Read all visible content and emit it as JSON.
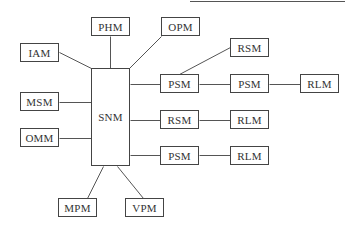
{
  "diagram": {
    "type": "block-diagram",
    "top_rule": {
      "x1": 190,
      "y1": 1,
      "x2": 345,
      "y2": 1
    },
    "nodes": [
      {
        "id": "iam",
        "label": "IAM",
        "x": 20,
        "y": 43,
        "w": 39,
        "h": 19
      },
      {
        "id": "phm",
        "label": "PHM",
        "x": 91,
        "y": 17,
        "w": 39,
        "h": 19
      },
      {
        "id": "opm",
        "label": "OPM",
        "x": 161,
        "y": 17,
        "w": 39,
        "h": 19
      },
      {
        "id": "snm",
        "label": "SNM",
        "x": 91,
        "y": 68,
        "w": 39,
        "h": 98
      },
      {
        "id": "msm",
        "label": "MSM",
        "x": 20,
        "y": 92,
        "w": 39,
        "h": 19
      },
      {
        "id": "omm",
        "label": "OMM",
        "x": 20,
        "y": 128,
        "w": 39,
        "h": 19
      },
      {
        "id": "psm1",
        "label": "PSM",
        "x": 160,
        "y": 74,
        "w": 39,
        "h": 19
      },
      {
        "id": "rsm1",
        "label": "RSM",
        "x": 230,
        "y": 38,
        "w": 39,
        "h": 19
      },
      {
        "id": "psm2",
        "label": "PSM",
        "x": 230,
        "y": 74,
        "w": 39,
        "h": 19
      },
      {
        "id": "rlm1",
        "label": "RLM",
        "x": 300,
        "y": 74,
        "w": 39,
        "h": 19
      },
      {
        "id": "rsm2",
        "label": "RSM",
        "x": 160,
        "y": 110,
        "w": 39,
        "h": 19
      },
      {
        "id": "rlm2",
        "label": "RLM",
        "x": 230,
        "y": 110,
        "w": 39,
        "h": 19
      },
      {
        "id": "psm3",
        "label": "PSM",
        "x": 160,
        "y": 146,
        "w": 39,
        "h": 19
      },
      {
        "id": "rlm3",
        "label": "RLM",
        "x": 230,
        "y": 146,
        "w": 39,
        "h": 19
      },
      {
        "id": "mpm",
        "label": "MPM",
        "x": 58,
        "y": 198,
        "w": 39,
        "h": 19
      },
      {
        "id": "vpm",
        "label": "VPM",
        "x": 125,
        "y": 198,
        "w": 39,
        "h": 19
      }
    ],
    "edges": [
      {
        "from": "iam",
        "to": "snm",
        "x1": 59,
        "y1": 52,
        "x2": 91,
        "y2": 68
      },
      {
        "from": "phm",
        "to": "snm",
        "x1": 110,
        "y1": 36,
        "x2": 110,
        "y2": 68
      },
      {
        "from": "opm",
        "to": "snm",
        "x1": 161,
        "y1": 36,
        "x2": 129,
        "y2": 68
      },
      {
        "from": "msm",
        "to": "snm",
        "x1": 59,
        "y1": 102,
        "x2": 91,
        "y2": 102
      },
      {
        "from": "omm",
        "to": "snm",
        "x1": 59,
        "y1": 138,
        "x2": 91,
        "y2": 138
      },
      {
        "from": "snm",
        "to": "psm1",
        "x1": 130,
        "y1": 84,
        "x2": 160,
        "y2": 84
      },
      {
        "from": "psm1",
        "to": "rsm1",
        "x1": 179,
        "y1": 74,
        "x2": 230,
        "y2": 47
      },
      {
        "from": "psm1",
        "to": "psm2",
        "x1": 199,
        "y1": 84,
        "x2": 230,
        "y2": 84
      },
      {
        "from": "psm2",
        "to": "rlm1",
        "x1": 269,
        "y1": 84,
        "x2": 300,
        "y2": 84
      },
      {
        "from": "snm",
        "to": "rsm2",
        "x1": 130,
        "y1": 120,
        "x2": 160,
        "y2": 120
      },
      {
        "from": "rsm2",
        "to": "rlm2",
        "x1": 199,
        "y1": 120,
        "x2": 230,
        "y2": 120
      },
      {
        "from": "snm",
        "to": "psm3",
        "x1": 130,
        "y1": 155,
        "x2": 160,
        "y2": 155
      },
      {
        "from": "psm3",
        "to": "rlm3",
        "x1": 199,
        "y1": 155,
        "x2": 230,
        "y2": 155
      },
      {
        "from": "snm",
        "to": "mpm",
        "x1": 103,
        "y1": 166,
        "x2": 87,
        "y2": 198
      },
      {
        "from": "snm",
        "to": "vpm",
        "x1": 117,
        "y1": 166,
        "x2": 143,
        "y2": 198
      }
    ]
  }
}
